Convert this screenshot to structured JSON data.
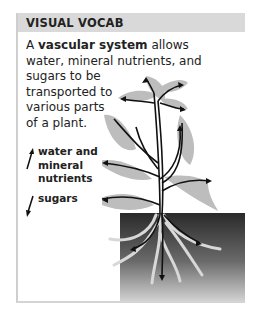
{
  "header": {
    "title": "VISUAL VOCAB"
  },
  "intro": {
    "prefix": "A ",
    "term": "vascular system",
    "suffix": " allows water, mineral nutrients, and sugars to be transported to various parts of a plant.",
    "lines": [
      "allows",
      "water, mineral nutrients, and",
      "sugars to be",
      "transported to",
      "various parts",
      "of a plant."
    ]
  },
  "legend": [
    {
      "icon": "arrow-up-icon",
      "label_lines": [
        "water and",
        "mineral",
        "nutrients"
      ]
    },
    {
      "icon": "arrow-down-icon",
      "label_lines": [
        "sugars"
      ]
    }
  ],
  "colors": {
    "header_bg": "#d9d9d9",
    "leaf": "#bdbdbd",
    "soil_top": "#2a2a2a",
    "stem": "#111111"
  }
}
